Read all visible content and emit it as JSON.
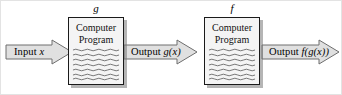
{
  "diagram": {
    "colors": {
      "arrow_fill": "#e0e0e0",
      "arrow_stroke": "#6e6e6e",
      "box_fill": "#f4f4f4",
      "box_stroke": "#1a1a1a",
      "shadow": "#8c8c8c",
      "text": "#000000",
      "background": "#ffffff"
    },
    "arrows": [
      {
        "name": "input-arrow",
        "label_prefix": "Input ",
        "label_var": "x",
        "label_suffix": "",
        "full_label": "Input x",
        "direction": "right"
      },
      {
        "name": "middle-arrow",
        "label_prefix": "Output ",
        "label_var": "g",
        "label_suffix": "(x)",
        "full_label": "Output g(x)",
        "direction": "right"
      },
      {
        "name": "output-arrow",
        "label_prefix": "Output ",
        "label_var": "f",
        "label_suffix": "(g(x))",
        "full_label": "Output f(g(x))",
        "direction": "right"
      }
    ],
    "boxes": [
      {
        "name": "program-box-g",
        "function_letter": "g",
        "title_line1": "Computer",
        "title_line2": "Program",
        "code_line_count": 7
      },
      {
        "name": "program-box-f",
        "function_letter": "f",
        "title_line1": "Computer",
        "title_line2": "Program",
        "code_line_count": 7
      }
    ]
  }
}
